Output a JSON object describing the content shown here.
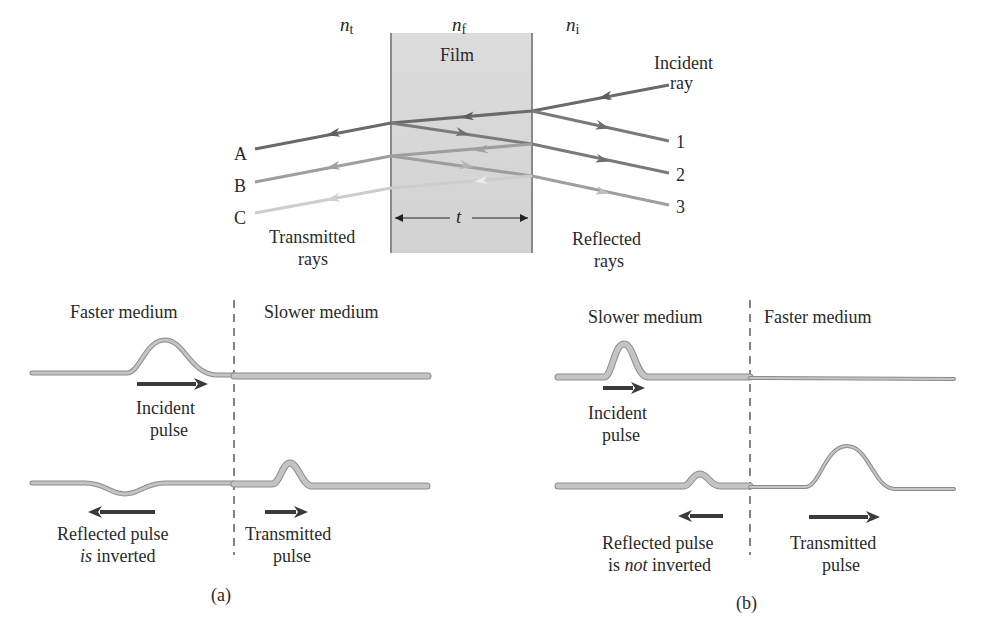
{
  "top_diagram": {
    "media": {
      "transmitted_side": {
        "symbol": "n",
        "subscript": "t"
      },
      "film": {
        "symbol": "n",
        "subscript": "f",
        "label": "Film"
      },
      "incident_side": {
        "symbol": "n",
        "subscript": "i"
      }
    },
    "incident_label_line1": "Incident",
    "incident_label_line2": "ray",
    "transmitted_rays": [
      "A",
      "B",
      "C"
    ],
    "reflected_rays": [
      "1",
      "2",
      "3"
    ],
    "thickness_symbol": "t",
    "transmitted_caption_line1": "Transmitted",
    "transmitted_caption_line2": "rays",
    "reflected_caption_line1": "Reflected",
    "reflected_caption_line2": "rays",
    "colors": {
      "film_fill": "#d6d6d6",
      "film_border": "#8a8a8a",
      "ray_a": "#6a6a6a",
      "ray_b": "#9a9a9a",
      "ray_c": "#c8c8c8"
    }
  },
  "panel_a": {
    "left_medium": "Faster medium",
    "right_medium": "Slower medium",
    "incident_line1": "Incident",
    "incident_line2": "pulse",
    "reflected_line1": "Reflected pulse",
    "reflected_line2_emph": "is",
    "reflected_line2_rest": " inverted",
    "transmitted_line1": "Transmitted",
    "transmitted_line2": "pulse",
    "caption": "(a)"
  },
  "panel_b": {
    "left_medium": "Slower medium",
    "right_medium": "Faster medium",
    "incident_line1": "Incident",
    "incident_line2": "pulse",
    "reflected_line1": "Reflected pulse",
    "reflected_line2_pre": "is ",
    "reflected_line2_emph": "not",
    "reflected_line2_rest": " inverted",
    "transmitted_line1": "Transmitted",
    "transmitted_line2": "pulse",
    "caption": "(b)"
  },
  "colors": {
    "string_fill": "#bdbdbd",
    "string_edge": "#8c8c8c",
    "arrow": "#3a3a3a",
    "text": "#2a2a2a"
  }
}
